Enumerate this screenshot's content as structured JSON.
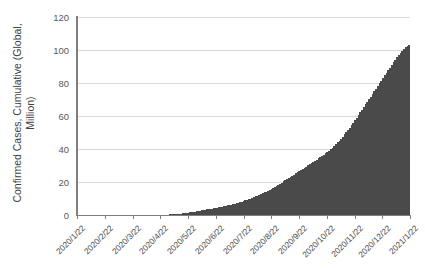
{
  "chart_data": {
    "type": "bar",
    "title": "",
    "subtitle": "",
    "xlabel": "",
    "ylabel": "Confirmed Cases, Cumulative (Global, Million)",
    "ylabel_lines": [
      "Confirmed Cases, Cumulative (Global,",
      "Million)"
    ],
    "ylim": [
      0,
      120
    ],
    "y_ticks": [
      0,
      20,
      40,
      60,
      80,
      100,
      120
    ],
    "y_tick_labels": [
      "0",
      "20",
      "40",
      "60",
      "80",
      "100",
      "120"
    ],
    "grid": true,
    "grid_axis": "y",
    "legend": "none",
    "x_tick_labels": [
      "2020/1/22",
      "2020/2/22",
      "2020/3/22",
      "2020/4/22",
      "2020/5/22",
      "2020/6/22",
      "2020/7/22",
      "2020/8/22",
      "2020/9/22",
      "2020/10/22",
      "2020/11/22",
      "2020/12/22",
      "2021/1/22"
    ],
    "x_tick_rotation": -45,
    "series_name": "Confirmed Cases, Cumulative (Global, Million)",
    "units": "Million",
    "bar_color": "#7d7d7d",
    "bar_edge_color": "#4a4a4a",
    "gridline_color": "#d9d9d9",
    "axis_color": "#7f7f7f",
    "peak_value": 103,
    "categories": [
      "2020/1/22",
      "2020/2/5",
      "2020/2/19",
      "2020/3/4",
      "2020/3/18",
      "2020/4/1",
      "2020/4/15",
      "2020/4/29",
      "2020/5/13",
      "2020/5/27",
      "2020/6/10",
      "2020/6/24",
      "2020/7/8",
      "2020/7/22",
      "2020/8/5",
      "2020/8/19",
      "2020/9/2",
      "2020/9/16",
      "2020/9/30",
      "2020/10/14",
      "2020/10/28",
      "2020/11/11",
      "2020/11/25",
      "2020/12/9",
      "2020/12/23",
      "2021/1/6",
      "2021/1/22"
    ],
    "values": [
      0.0,
      0.03,
      0.08,
      0.1,
      0.25,
      0.9,
      2.0,
      3.1,
      4.3,
      5.6,
      7.5,
      9.4,
      12.0,
      15.0,
      18.8,
      22.3,
      25.8,
      29.8,
      33.8,
      38.5,
      44.0,
      52.0,
      60.0,
      68.8,
      78.0,
      87.5,
      103.0
    ],
    "daily_series_note": "daily cumulative bars from 2020/1/22 to 2021/1/22",
    "daily_values": [
      0.0,
      0.0,
      0.0,
      0.0,
      0.01,
      0.01,
      0.01,
      0.02,
      0.02,
      0.03,
      0.03,
      0.04,
      0.04,
      0.05,
      0.05,
      0.06,
      0.06,
      0.07,
      0.07,
      0.07,
      0.07,
      0.08,
      0.08,
      0.08,
      0.08,
      0.08,
      0.08,
      0.08,
      0.08,
      0.09,
      0.09,
      0.09,
      0.09,
      0.09,
      0.09,
      0.09,
      0.09,
      0.09,
      0.09,
      0.09,
      0.09,
      0.1,
      0.1,
      0.1,
      0.1,
      0.11,
      0.12,
      0.13,
      0.15,
      0.17,
      0.2,
      0.23,
      0.27,
      0.33,
      0.4,
      0.47,
      0.55,
      0.64,
      0.74,
      0.85,
      0.97,
      1.1,
      1.24,
      1.39,
      1.55,
      1.72,
      1.9,
      2.08,
      2.26,
      2.45,
      2.64,
      2.83,
      3.02,
      3.2,
      3.38,
      3.56,
      3.74,
      3.92,
      4.1,
      4.29,
      4.48,
      4.68,
      4.89,
      5.11,
      5.34,
      5.58,
      5.83,
      6.09,
      6.36,
      6.64,
      6.93,
      7.23,
      7.54,
      7.86,
      8.19,
      8.53,
      8.88,
      9.24,
      9.62,
      10.0,
      10.4,
      10.82,
      11.25,
      11.7,
      12.16,
      12.64,
      13.14,
      13.65,
      14.18,
      14.73,
      15.3,
      15.89,
      16.49,
      17.1,
      17.73,
      18.37,
      19.02,
      19.68,
      20.35,
      21.03,
      21.72,
      22.41,
      23.1,
      23.8,
      24.5,
      25.2,
      25.9,
      26.6,
      27.3,
      28.0,
      28.7,
      29.4,
      30.1,
      30.8,
      31.5,
      32.2,
      32.9,
      33.6,
      34.3,
      35.0,
      35.8,
      36.6,
      37.4,
      38.2,
      39.1,
      40.0,
      40.9,
      41.9,
      42.9,
      44.0,
      45.1,
      46.3,
      47.5,
      48.8,
      50.1,
      51.5,
      52.9,
      54.4,
      55.9,
      57.4,
      59.0,
      60.6,
      62.2,
      63.8,
      65.4,
      67.0,
      68.6,
      70.2,
      71.8,
      73.4,
      75.0,
      76.6,
      78.2,
      79.8,
      81.4,
      83.0,
      84.6,
      86.2,
      87.8,
      89.4,
      91.0,
      92.6,
      94.2,
      95.7,
      97.1,
      98.4,
      99.6,
      100.7,
      101.7,
      102.5,
      103.0
    ]
  }
}
